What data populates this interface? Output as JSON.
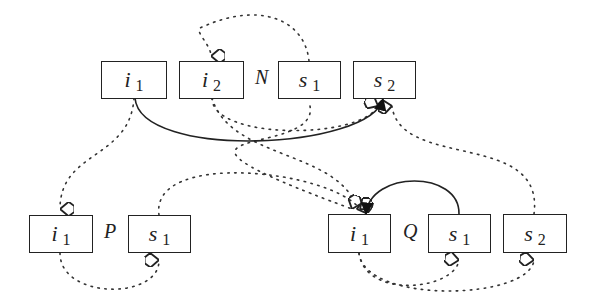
{
  "diagram": {
    "groups": [
      {
        "label": "N",
        "nodes": [
          {
            "id": "N_i1",
            "name": "i",
            "sub": "1"
          },
          {
            "id": "N_i2",
            "name": "i",
            "sub": "2"
          },
          {
            "id": "N_s1",
            "name": "s",
            "sub": "1"
          },
          {
            "id": "N_s2",
            "name": "s",
            "sub": "2"
          }
        ]
      },
      {
        "label": "P",
        "nodes": [
          {
            "id": "P_i1",
            "name": "i",
            "sub": "1"
          },
          {
            "id": "P_s1",
            "name": "s",
            "sub": "1"
          }
        ]
      },
      {
        "label": "Q",
        "nodes": [
          {
            "id": "Q_i1",
            "name": "i",
            "sub": "1"
          },
          {
            "id": "Q_s1",
            "name": "s",
            "sub": "1"
          },
          {
            "id": "Q_s2",
            "name": "s",
            "sub": "2"
          }
        ]
      }
    ],
    "edges": [
      {
        "from": "N_s1",
        "to": "N_i2",
        "style": "dotted",
        "head": "open-diamond"
      },
      {
        "from": "N_i1",
        "to": "N_s2",
        "style": "solid",
        "head": "filled-arrow"
      },
      {
        "from": "N_i2",
        "to": "N_s2",
        "style": "dotted",
        "head": "open-diamond"
      },
      {
        "from": "N_i2",
        "to": "Q_i1",
        "style": "dotted",
        "head": "open-diamond"
      },
      {
        "from": "N_s1",
        "to": "Q_i1",
        "style": "dotted",
        "head": "open-diamond"
      },
      {
        "from": "Q_s2",
        "to": "N_s2",
        "style": "dotted",
        "head": "open-diamond"
      },
      {
        "from": "N_i1",
        "to": "P_i1",
        "style": "dotted",
        "head": "open-diamond"
      },
      {
        "from": "P_s1",
        "to": "Q_i1",
        "style": "dotted",
        "head": "open-diamond"
      },
      {
        "from": "P_i1",
        "to": "P_s1",
        "style": "dotted",
        "head": "open-diamond"
      },
      {
        "from": "Q_s1",
        "to": "Q_i1",
        "style": "solid",
        "head": "filled-arrow"
      },
      {
        "from": "Q_i1",
        "to": "Q_s1",
        "style": "dotted",
        "head": "open-diamond"
      },
      {
        "from": "Q_i1",
        "to": "Q_s2",
        "style": "dotted",
        "head": "open-diamond"
      }
    ]
  }
}
